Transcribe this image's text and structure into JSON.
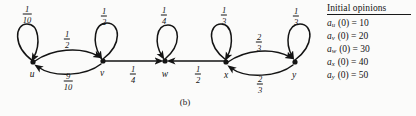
{
  "figure": {
    "caption": "(b)",
    "background": "#fbfbfa",
    "ink": "#141414"
  },
  "graph": {
    "nodes": [
      {
        "id": "u",
        "label": "u",
        "x": 33,
        "y": 62,
        "label_x": 32,
        "label_y": 74
      },
      {
        "id": "v",
        "label": "v",
        "x": 103,
        "y": 61,
        "label_x": 102,
        "label_y": 73
      },
      {
        "id": "w",
        "label": "w",
        "x": 165,
        "y": 61,
        "label_x": 165,
        "label_y": 74
      },
      {
        "id": "x",
        "label": "x",
        "x": 226,
        "y": 62,
        "label_x": 226,
        "label_y": 75
      },
      {
        "id": "y",
        "label": "y",
        "x": 295,
        "y": 62,
        "label_x": 294,
        "label_y": 75
      }
    ],
    "edges": [
      {
        "from": "u",
        "to": "u",
        "kind": "self-loop",
        "num": "1",
        "den": "10",
        "label_x": 27,
        "label_y": 14
      },
      {
        "from": "u",
        "to": "v",
        "kind": "arc-upper",
        "num": "1",
        "den": "2",
        "label_x": 67,
        "label_y": 39
      },
      {
        "from": "v",
        "to": "u",
        "kind": "arc-lower",
        "num": "9",
        "den": "10",
        "label_x": 68,
        "label_y": 81
      },
      {
        "from": "v",
        "to": "v",
        "kind": "self-loop",
        "num": "1",
        "den": "2",
        "label_x": 104,
        "label_y": 16
      },
      {
        "from": "v",
        "to": "w",
        "kind": "straight",
        "num": "1",
        "den": "4",
        "label_x": 133,
        "label_y": 74
      },
      {
        "from": "w",
        "to": "w",
        "kind": "self-loop",
        "num": "1",
        "den": "4",
        "label_x": 164,
        "label_y": 15
      },
      {
        "from": "x",
        "to": "w",
        "kind": "straight",
        "num": "1",
        "den": "2",
        "label_x": 198,
        "label_y": 74
      },
      {
        "from": "x",
        "to": "x",
        "kind": "self-loop",
        "num": "1",
        "den": "3",
        "label_x": 224,
        "label_y": 15
      },
      {
        "from": "x",
        "to": "y",
        "kind": "arc-upper",
        "num": "2",
        "den": "3",
        "label_x": 259,
        "label_y": 42
      },
      {
        "from": "y",
        "to": "x",
        "kind": "arc-lower",
        "num": "2",
        "den": "3",
        "label_x": 260,
        "label_y": 84
      },
      {
        "from": "y",
        "to": "y",
        "kind": "self-loop",
        "num": "1",
        "den": "3",
        "label_x": 296,
        "label_y": 16
      }
    ]
  },
  "legend": {
    "title": "Initial opinions",
    "rows": [
      {
        "var": "a",
        "sub": "u",
        "rest": " (0) = 10"
      },
      {
        "var": "a",
        "sub": "v",
        "rest": " (0) = 20"
      },
      {
        "var": "a",
        "sub": "w",
        "rest": " (0) = 30"
      },
      {
        "var": "a",
        "sub": "x",
        "rest": " (0) = 40"
      },
      {
        "var": "a",
        "sub": "y",
        "rest": " (0) = 50"
      }
    ]
  }
}
